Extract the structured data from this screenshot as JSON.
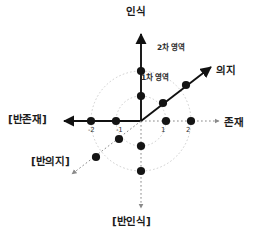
{
  "diagram": {
    "origin": {
      "x": 141,
      "y": 121
    },
    "unit_px": 25,
    "axes": [
      {
        "id": "axis-vertical",
        "name": "인식축",
        "positive_label": "인식",
        "negative_label": "[반인식]",
        "style_positive": "solid",
        "style_negative": "dotted"
      },
      {
        "id": "axis-horizontal",
        "name": "존재축",
        "positive_label": "존재",
        "negative_label": "[반존재]",
        "style_positive": "dotted",
        "style_negative": "solid"
      },
      {
        "id": "axis-diagonal",
        "name": "의지축",
        "positive_label": "의지",
        "negative_label": "[반의지]",
        "style_positive": "solid",
        "style_negative": "dotted"
      }
    ],
    "tick_labels": {
      "minus_two": "-2",
      "minus_one": "-1",
      "plus_one": "1",
      "plus_two": "2"
    },
    "regions": [
      {
        "id": "region-1",
        "label": "1차 영역",
        "radius_units": 1
      },
      {
        "id": "region-2",
        "label": "2차 영역",
        "radius_units": 2
      }
    ],
    "colors": {
      "axis": "#111111",
      "dotted": "#8a8a8a",
      "circle": "#bdbdbd",
      "point": "#141414",
      "text": "#1a1a1a",
      "background": "#ffffff"
    },
    "points": [
      {
        "axis": "인식",
        "value": 1,
        "cx": 141,
        "cy": 96
      },
      {
        "axis": "인식",
        "value": 2,
        "cx": 141,
        "cy": 71
      },
      {
        "axis": "[반인식]",
        "value": -1,
        "cx": 141,
        "cy": 146
      },
      {
        "axis": "[반인식]",
        "value": -2,
        "cx": 141,
        "cy": 171
      },
      {
        "axis": "존재",
        "value": 1,
        "cx": 166,
        "cy": 121
      },
      {
        "axis": "존재",
        "value": 2,
        "cx": 191,
        "cy": 121
      },
      {
        "axis": "[반존재]",
        "value": -1,
        "cx": 116,
        "cy": 121
      },
      {
        "axis": "[반존재]",
        "value": -2,
        "cx": 91,
        "cy": 121
      },
      {
        "axis": "의지",
        "value": 1,
        "cx": 163,
        "cy": 103
      },
      {
        "axis": "의지",
        "value": 2,
        "cx": 186,
        "cy": 85
      },
      {
        "axis": "[반의지]",
        "value": -1,
        "cx": 119,
        "cy": 139
      },
      {
        "axis": "[반의지]",
        "value": -2,
        "cx": 96,
        "cy": 157
      }
    ]
  }
}
